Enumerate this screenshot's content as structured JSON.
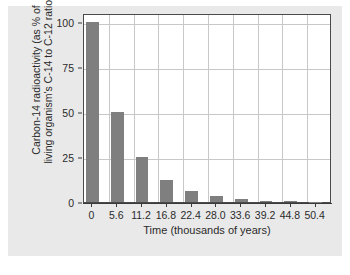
{
  "chart_data": {
    "type": "bar",
    "title": "",
    "xlabel": "Time (thousands of years)",
    "ylabel_line1": "Carbon-14 radioactivity (as % of",
    "ylabel_line2": "living organism's C-14 to C-12 ratio)",
    "categories": [
      "0",
      "5.6",
      "11.2",
      "16.8",
      "22.4",
      "28.0",
      "33.6",
      "39.2",
      "44.8",
      "50.4"
    ],
    "values": [
      100,
      50,
      25,
      12.5,
      6.25,
      3.13,
      1.56,
      0.78,
      0.39,
      0.2
    ],
    "ylim": [
      0,
      105
    ],
    "yticks": [
      "0",
      "25",
      "50",
      "75",
      "100"
    ],
    "ytick_values": [
      0,
      25,
      50,
      75,
      100
    ],
    "grid": "both",
    "legend": "none",
    "bar_color": "#7f7f7f",
    "plot_background": "#ffffff",
    "figure_background": "#e9e9e9",
    "grid_color": "#c8c8c8",
    "axis_color": "#3a3a3a",
    "text_color": "#2b2b2b"
  }
}
